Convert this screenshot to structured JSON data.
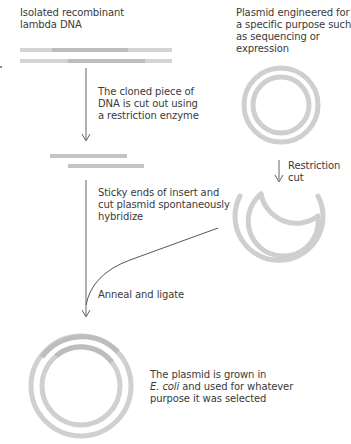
{
  "diagram": {
    "colors": {
      "dna_light": "#d4d4d4",
      "dna_dark": "#bdbdbd",
      "plasmid": "#cfcfcf",
      "plasmid_insert": "#bcbcbc",
      "arrow": "#666666",
      "text": "#3a3a3a"
    },
    "labels": {
      "lambda_dna": [
        "Isolated recombinant",
        "lambda DNA"
      ],
      "plasmid_engineered": [
        "Plasmid engineered for",
        "a specific purpose such",
        "as sequencing or",
        "expression"
      ],
      "cut_out": [
        "The cloned piece of",
        "DNA is cut out using",
        "a restriction enzyme"
      ],
      "restriction_cut": [
        "Restriction",
        "cut"
      ],
      "sticky_ends": [
        "Sticky ends of insert and",
        "cut plasmid spontaneously",
        "hybridize"
      ],
      "anneal": [
        "Anneal and ligate"
      ],
      "final": {
        "line1": "The plasmid is grown in",
        "line2_italic": "E. coli",
        "line2_rest": " and used for whatever",
        "line3": "purpose it was selected"
      }
    },
    "nodes": [
      {
        "id": "lambda-dna",
        "type": "double-strand-dna",
        "insert_highlight": true
      },
      {
        "id": "engineered-plasmid",
        "type": "circular-plasmid"
      },
      {
        "id": "excised-insert",
        "type": "double-strand-fragment"
      },
      {
        "id": "cut-plasmid",
        "type": "open-circular-plasmid"
      },
      {
        "id": "recombinant-plasmid",
        "type": "circular-plasmid",
        "insert_highlight": true
      }
    ],
    "edges": [
      {
        "from": "lambda-dna",
        "to": "excised-insert",
        "label": "cut_out"
      },
      {
        "from": "engineered-plasmid",
        "to": "cut-plasmid",
        "label": "restriction_cut"
      },
      {
        "from": "excised-insert",
        "to": "recombinant-plasmid",
        "label": "anneal"
      },
      {
        "from": "cut-plasmid",
        "to": "recombinant-plasmid",
        "label": "sticky_ends"
      }
    ]
  }
}
